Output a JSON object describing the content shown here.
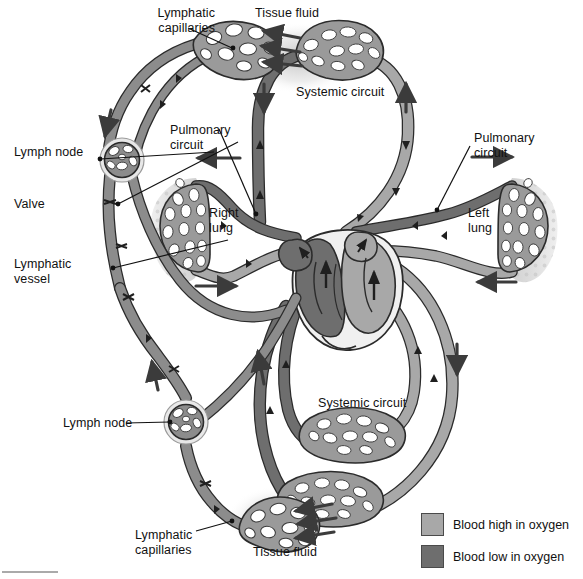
{
  "figure": {
    "colors": {
      "blood_high_oxygen": "#a8a8a8",
      "blood_low_oxygen": "#6e6e6e",
      "lymph_vessel": "#8c8c8c",
      "outline": "#2b2b2b",
      "lung_tissue": "#d8d8d8",
      "background": "#ffffff",
      "text": "#111111"
    }
  },
  "labels": [
    {
      "id": "lymphatic-capillaries-top",
      "text": "Lymphatic\ncapillaries",
      "x": 127,
      "y": 6
    },
    {
      "id": "tissue-fluid-top",
      "text": "Tissue fluid",
      "x": 255,
      "y": 6
    },
    {
      "id": "systemic-circuit-top",
      "text": "Systemic circuit",
      "x": 296,
      "y": 85
    },
    {
      "id": "pulmonary-circuit-left",
      "text": "Pulmonary\ncircuit",
      "x": 170,
      "y": 123
    },
    {
      "id": "pulmonary-circuit-right",
      "text": "Pulmonary\ncircuit",
      "x": 474,
      "y": 131
    },
    {
      "id": "lymph-node-upper",
      "text": "Lymph node",
      "x": 14,
      "y": 145
    },
    {
      "id": "valve",
      "text": "Valve",
      "x": 14,
      "y": 197
    },
    {
      "id": "right-lung",
      "text": "Right\nlung",
      "x": 209,
      "y": 206
    },
    {
      "id": "left-lung",
      "text": "Left\nlung",
      "x": 468,
      "y": 206
    },
    {
      "id": "lymphatic-vessel",
      "text": "Lymphatic\nvessel",
      "x": 14,
      "y": 257
    },
    {
      "id": "lymph-node-lower",
      "text": "Lymph node",
      "x": 63,
      "y": 416
    },
    {
      "id": "systemic-circuit-bottom",
      "text": "Systemic circuit",
      "x": 318,
      "y": 396
    },
    {
      "id": "lymphatic-capillaries-bottom",
      "text": "Lymphatic\ncapillaries",
      "x": 135,
      "y": 528
    },
    {
      "id": "tissue-fluid-bottom",
      "text": "Tissue fluid",
      "x": 253,
      "y": 545
    }
  ],
  "legend": {
    "items": [
      {
        "id": "legend-high-oxygen",
        "label": "Blood high in oxygen",
        "color": "#a8a8a8",
        "x": 421,
        "y": 513
      },
      {
        "id": "legend-low-oxygen",
        "label": "Blood low in oxygen",
        "color": "#6e6e6e",
        "x": 421,
        "y": 545
      }
    ]
  },
  "structures": {
    "heart": "heart",
    "right_lung": "right-lung",
    "left_lung": "left-lung",
    "lymph_nodes": 2,
    "valves": 7,
    "capillary_beds": 6
  }
}
